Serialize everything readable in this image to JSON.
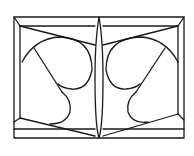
{
  "figure": {
    "type": "line-drawing",
    "stroke_color": "#1a1a1a",
    "background_color": "#ffffff",
    "outer_frame": {
      "x1": 14,
      "y1": 17,
      "x2": 184,
      "y2": 138
    },
    "inner_frame": {
      "x1": 20,
      "y1": 26,
      "x2": 178,
      "y2": 130
    },
    "bottom_band_y": 128,
    "center_spindle": {
      "x": 99,
      "top": 17,
      "bottom": 138,
      "max_half_width": 4
    },
    "halves": [
      "left",
      "right"
    ]
  }
}
